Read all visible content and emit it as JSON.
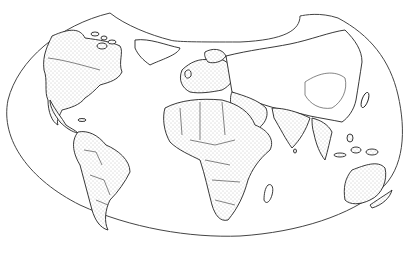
{
  "map": {
    "type": "world-map",
    "projection": "lobed-interrupted",
    "style": "black-and-white line art with stippled countries",
    "colors": {
      "background": "#ffffff",
      "outline": "#444444",
      "stipple": "#9a9a9a",
      "coast": "#222222"
    },
    "regions": [
      {
        "id": "north-america",
        "label": ""
      },
      {
        "id": "south-america",
        "label": ""
      },
      {
        "id": "europe",
        "label": ""
      },
      {
        "id": "africa",
        "label": ""
      },
      {
        "id": "asia",
        "label": ""
      },
      {
        "id": "australia",
        "label": ""
      },
      {
        "id": "greenland",
        "label": ""
      },
      {
        "id": "madagascar",
        "label": ""
      },
      {
        "id": "new-zealand",
        "label": ""
      }
    ]
  }
}
